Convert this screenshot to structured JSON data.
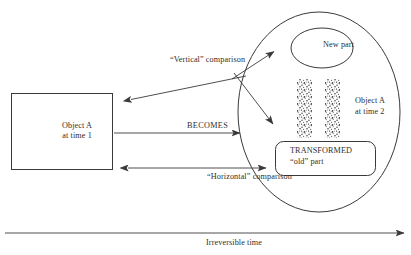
{
  "figure": {
    "type": "conceptual-diagram",
    "background_color": "#ffffff",
    "stroke_color": "#3a3a3a",
    "text_color": "#2f2f2f"
  },
  "nodes": {
    "source_box": {
      "shape": "rectangle",
      "line1": "Object A",
      "line2": "at time 1"
    },
    "target_ellipse": {
      "shape": "ellipse",
      "label": "Object A at time 2 container"
    },
    "new_part": {
      "shape": "ellipse",
      "label": "New part"
    },
    "object_a_t2": {
      "line1": "Object A",
      "line2": "at time 2"
    },
    "transformed_part": {
      "shape": "rounded-rectangle",
      "line1": "TRANSFORMED",
      "line2": "“old” part"
    },
    "stipple_bars": {
      "label": "stippled-texture-bars",
      "count": 2
    }
  },
  "edges": {
    "vertical_comparison": {
      "label": "“Vertical” comparison",
      "arrowheads": "both"
    },
    "becomes": {
      "label": "BECOMES",
      "arrowheads": "end"
    },
    "horizontal_comparison": {
      "label": "“Horizontal” comparison",
      "arrowheads": "both"
    },
    "time_axis": {
      "label": "Irreversible time",
      "arrowheads": "end"
    }
  }
}
